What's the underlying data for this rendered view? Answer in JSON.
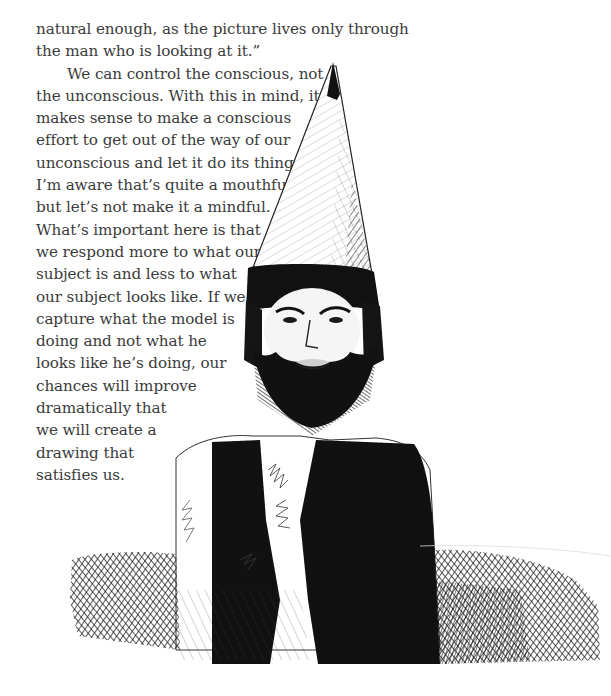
{
  "page": {
    "text": {
      "paragraph_1_lines": [
        "natural enough, as the picture lives only through",
        "the man who is looking at it.”"
      ],
      "paragraph_2_lines": [
        "We can control the conscious, not",
        "the unconscious. With this in mind, it",
        "makes sense to make a conscious",
        "effort to get out of the way of our",
        "unconscious and let it do its thing.",
        "I’m aware that’s quite a mouthful,",
        "but let’s not make it a mindful.",
        "What’s important here is that",
        "we respond more to what our",
        "subject is and less to what",
        "our subject looks like. If we",
        "capture what the model is",
        "doing and not what he",
        "looks like he’s doing, our",
        "chances will improve",
        "dramatically that",
        "we will create a",
        "drawing that",
        "satisfies us."
      ]
    },
    "illustration": {
      "description": "pen-and-ink cross-hatched drawing of a bearded man wearing a tall conical hat and a dark vest over a light shirt",
      "ink_color": "#111111",
      "paper_color": "#ffffff"
    }
  }
}
